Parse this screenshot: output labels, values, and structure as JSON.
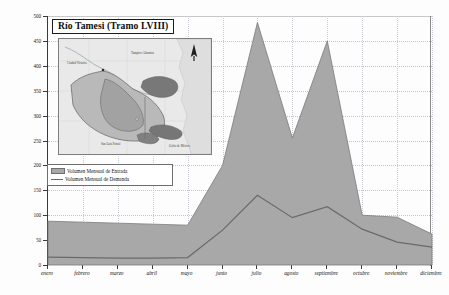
{
  "chart_data": {
    "type": "area",
    "title": "Río Tamesi (Tramo LVIII)",
    "xlabel": "",
    "ylabel": "Volumen de Agua (Millones de m³)",
    "ylim": [
      0,
      500
    ],
    "ytick_step": 50,
    "yticks": [
      "0",
      "50",
      "100",
      "150",
      "200",
      "250",
      "300",
      "350",
      "400",
      "450",
      "500"
    ],
    "grid": true,
    "legend_position": "inner-left",
    "categories": [
      "enero",
      "febrero",
      "marzo",
      "abril",
      "mayo",
      "junio",
      "julio",
      "agosto",
      "septiembre",
      "octubre",
      "noviembre",
      "diciembre"
    ],
    "series": [
      {
        "name": "Volumen Mensual de Entrada",
        "style": "filled-area",
        "color": "#a8a8a8",
        "values": [
          88,
          86,
          84,
          82,
          80,
          200,
          487,
          255,
          450,
          100,
          96,
          62
        ]
      },
      {
        "name": "Volumen Mensual de Demanda",
        "style": "line",
        "color": "#6a6a6a",
        "values": [
          16,
          15,
          14,
          14,
          15,
          70,
          140,
          95,
          117,
          72,
          46,
          36
        ]
      }
    ]
  },
  "legend": {
    "items": [
      {
        "label": "Volumen Mensual de Entrada",
        "swatch": "area-swatch"
      },
      {
        "label": "Volumen Mensual de Demanda",
        "swatch": "line-swatch"
      }
    ]
  },
  "inset_map": {
    "name": "watershed-location-map",
    "north_arrow_label": "N",
    "place_labels": [
      {
        "text": "Ciudad Victoria",
        "x": 16,
        "y": 24
      },
      {
        "text": "Tampico-Altamira",
        "x": 80,
        "y": 14
      },
      {
        "text": "San Luis Potosí",
        "x": 48,
        "y": 104
      },
      {
        "text": "Golfo de México",
        "x": 112,
        "y": 106
      }
    ]
  }
}
